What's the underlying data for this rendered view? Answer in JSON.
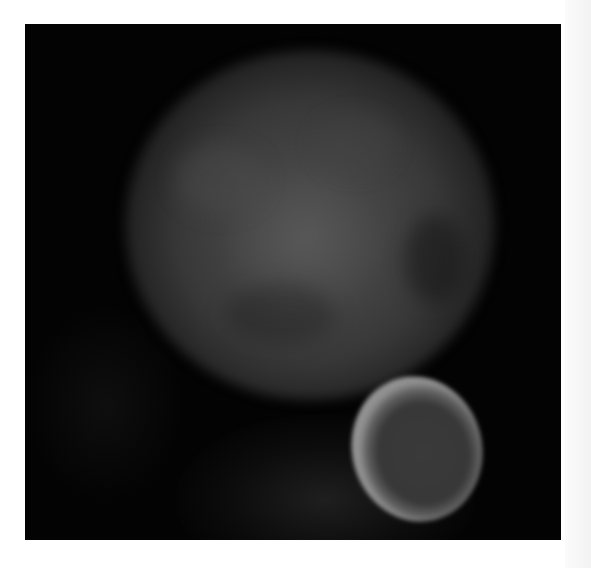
{
  "image": {
    "description": "Grayscale fluorescence micrograph on white page",
    "background_color": "#ffffff",
    "panel_color": "#030303",
    "subjects": [
      {
        "name": "large-cell",
        "shape": "diffuse round blob",
        "color": "#4e4e4e",
        "center": [
          305,
          220
        ],
        "radius": 165
      },
      {
        "name": "ring-cell",
        "shape": "bright elliptical ring with dark center",
        "ring_color": "#949494",
        "inner_color": "#3a3a3a",
        "center": [
          416,
          448
        ]
      }
    ]
  }
}
